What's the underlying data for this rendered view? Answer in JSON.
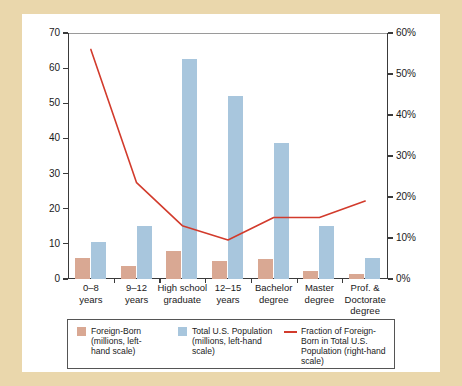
{
  "chart_data": {
    "type": "bar",
    "title": "",
    "subtitle": "",
    "xlabel": "",
    "ylabel": "",
    "y2label": "",
    "categories": [
      "0–8 years",
      "9–12 years",
      "High school graduate",
      "12–15 years",
      "Bachelor degree",
      "Master degree",
      "Prof. & Doctorate degree"
    ],
    "category_lines": [
      [
        "0–8",
        "years"
      ],
      [
        "9–12",
        "years"
      ],
      [
        "High school",
        "graduate"
      ],
      [
        "12–15",
        "years"
      ],
      [
        "Bachelor",
        "degree"
      ],
      [
        "Master",
        "degree"
      ],
      [
        "Prof. &",
        "Doctorate",
        "degree"
      ]
    ],
    "series": [
      {
        "name": "Foreign-Born (millions, left-hand scale)",
        "kind": "bar",
        "axis": "left",
        "color": "#d9a893",
        "values": [
          6.0,
          3.7,
          8.0,
          5.0,
          5.8,
          2.3,
          1.3
        ]
      },
      {
        "name": "Total U.S. Population (millions, left-hand scale)",
        "kind": "bar",
        "axis": "left",
        "color": "#a8c6dd",
        "values": [
          10.5,
          15.2,
          62.5,
          52.0,
          38.8,
          15.2,
          6.0
        ]
      },
      {
        "name": "Fraction of Foreign-Born in Total U.S. Population (right-hand scale)",
        "kind": "line",
        "axis": "right",
        "color": "#d23b2c",
        "values": [
          56.0,
          23.5,
          13.0,
          9.5,
          15.0,
          15.0,
          19.0
        ]
      }
    ],
    "ylim": [
      0,
      70
    ],
    "yticks": [
      0,
      10,
      20,
      30,
      40,
      50,
      60,
      70
    ],
    "ytick_labels": [
      "0",
      "10",
      "20",
      "30",
      "40",
      "50",
      "60",
      "70"
    ],
    "y2lim": [
      0,
      60
    ],
    "y2ticks": [
      0,
      10,
      20,
      30,
      40,
      50,
      60
    ],
    "y2tick_labels": [
      "0%",
      "10%",
      "20%",
      "30%",
      "40%",
      "50%",
      "60%"
    ],
    "grid": false,
    "legend_position": "bottom"
  },
  "legend": {
    "items": [
      {
        "swatch": "foreign-born-swatch",
        "lines": [
          "Foreign-Born",
          "(millions, left-",
          "hand scale)"
        ]
      },
      {
        "swatch": "total-population-swatch",
        "lines": [
          "Total U.S. Population",
          "(millions, left-hand",
          "scale)"
        ]
      },
      {
        "swatch": "fraction-line-swatch",
        "lines": [
          "Fraction of Foreign-",
          "Born in Total U.S.",
          "Population (right-hand",
          "scale)"
        ]
      }
    ]
  },
  "colors": {
    "foreign_born": "#d9a893",
    "total_population": "#a8c6dd",
    "fraction_line": "#d23b2c",
    "page_background": "#ead7ac",
    "panel_background": "#ffffff",
    "axis": "#3a3a3a"
  }
}
